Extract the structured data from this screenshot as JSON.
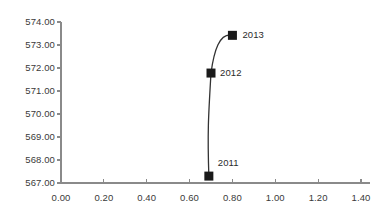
{
  "chart_data": {
    "type": "line",
    "title": "",
    "xlabel": "",
    "ylabel": "",
    "xlim": [
      0.0,
      1.4
    ],
    "ylim": [
      567.0,
      574.0
    ],
    "grid": false,
    "legend": "none",
    "marker": "square",
    "marker_color": "#1a1a1a",
    "line_color": "#333333",
    "axis_color": "#8a8a8a",
    "xticks": [
      "0.00",
      "0.20",
      "0.40",
      "0.60",
      "0.80",
      "1.00",
      "1.20",
      "1.40"
    ],
    "xtick_values": [
      0.0,
      0.2,
      0.4,
      0.6,
      0.8,
      1.0,
      1.2,
      1.4
    ],
    "yticks": [
      "567.00",
      "568.00",
      "569.00",
      "570.00",
      "571.00",
      "572.00",
      "573.00",
      "574.00"
    ],
    "ytick_values": [
      567.0,
      568.0,
      569.0,
      570.0,
      571.0,
      572.0,
      573.0,
      574.0
    ],
    "series": [
      {
        "name": "",
        "points": [
          {
            "label": "2011",
            "x": 0.69,
            "y": 567.3
          },
          {
            "label": "2012",
            "x": 0.7,
            "y": 571.78
          },
          {
            "label": "2013",
            "x": 0.8,
            "y": 573.42
          }
        ]
      }
    ],
    "annotations": [
      {
        "text": "2011",
        "x": 0.69,
        "y": 567.3
      },
      {
        "text": "2012",
        "x": 0.7,
        "y": 571.78
      },
      {
        "text": "2013",
        "x": 0.8,
        "y": 573.42
      }
    ]
  }
}
